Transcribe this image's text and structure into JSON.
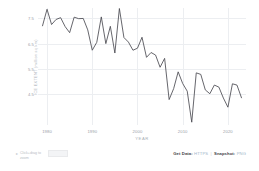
{
  "chart_data": {
    "type": "line",
    "title": "",
    "xlabel": "YEAR",
    "ylabel": "ICE EXTENT (million sq km)",
    "xlim": [
      1978,
      2024
    ],
    "ylim": [
      3.3,
      7.9
    ],
    "grid": true,
    "legend": "none",
    "line_color": "#4a4a52",
    "xticks": [
      "1980",
      "1990",
      "2000",
      "2010",
      "2020"
    ],
    "xtick_values": [
      1980,
      1990,
      2000,
      2010,
      2020
    ],
    "yticks": [
      "7.5",
      "6.5",
      "5.5",
      "4.5"
    ],
    "ytick_values": [
      7.5,
      6.5,
      5.5,
      4.5
    ],
    "x": [
      1979,
      1980,
      1981,
      1982,
      1983,
      1984,
      1985,
      1986,
      1987,
      1988,
      1989,
      1990,
      1991,
      1992,
      1993,
      1994,
      1995,
      1996,
      1997,
      1998,
      1999,
      2000,
      2001,
      2002,
      2003,
      2004,
      2005,
      2006,
      2007,
      2008,
      2009,
      2010,
      2011,
      2012,
      2013,
      2014,
      2015,
      2016,
      2017,
      2018,
      2019,
      2020,
      2021,
      2022,
      2023
    ],
    "values": [
      7.2,
      7.85,
      7.25,
      7.45,
      7.52,
      7.17,
      6.93,
      7.54,
      7.48,
      7.49,
      7.04,
      6.24,
      6.55,
      7.55,
      6.5,
      7.18,
      6.13,
      7.88,
      6.74,
      6.56,
      6.24,
      6.32,
      6.75,
      5.96,
      6.15,
      6.05,
      5.57,
      5.92,
      4.3,
      4.73,
      5.39,
      4.93,
      4.63,
      3.41,
      5.35,
      5.29,
      4.68,
      4.53,
      4.87,
      4.79,
      4.36,
      4.0,
      4.92,
      4.87,
      4.37
    ]
  },
  "axis": {
    "xlabel": "YEAR",
    "ylabel": "ICE EXTENT (million sq km)"
  },
  "footer": {
    "zoom_hint": "Click+drag to zoom",
    "zoom_arrow": "▸",
    "get_data_label": "Get Data:",
    "get_data_link": "HTTPS",
    "separator": "|",
    "snapshot_label": "Snapshot:",
    "snapshot_link": "PNG"
  }
}
